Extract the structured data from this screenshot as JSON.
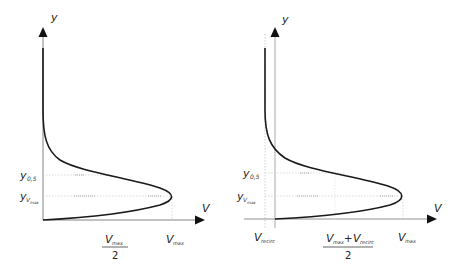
{
  "diagrams": [
    {
      "name": "velocity-profile",
      "axes": {
        "y_label": "y",
        "x_label": "V"
      },
      "y_ticks": [
        {
          "main": "y",
          "sub": "0,5"
        },
        {
          "main": "y",
          "sub": "V",
          "subsub": "max"
        }
      ],
      "x_ticks": [
        {
          "numerator_main": "V",
          "numerator_sub": "max",
          "denominator": "2"
        },
        {
          "main": "V",
          "sub": "max"
        }
      ]
    },
    {
      "name": "velocity-profile-recirculation",
      "axes": {
        "y_label": "y",
        "x_label": "V"
      },
      "y_ticks": [
        {
          "main": "y",
          "sub": "0,5"
        },
        {
          "main": "y",
          "sub": "V",
          "subsub": "max"
        }
      ],
      "x_ticks": [
        {
          "main": "V",
          "sub": "recirc"
        },
        {
          "numerator_a_main": "V",
          "numerator_a_sub": "max",
          "plus": "+",
          "numerator_b_main": "V",
          "numerator_b_sub": "recirc",
          "denominator": "2"
        },
        {
          "main": "V",
          "sub": "max"
        }
      ]
    }
  ],
  "colors": {
    "curve": "#1a1a1a",
    "axis": "#555555",
    "guide": "#bbbbbb"
  }
}
